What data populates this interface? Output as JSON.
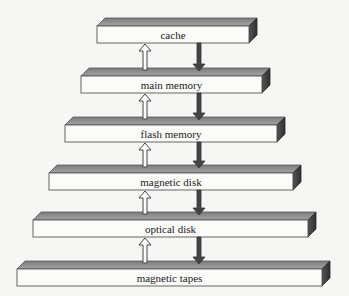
{
  "diagram": {
    "colors": {
      "background": "#f6f6f4",
      "front_face": "#fbfbfa",
      "top_face": "#8c8c8c",
      "side_face": "#3e3e3e",
      "outline": "#555555",
      "up_arrow_fill": "#ffffff",
      "down_arrow_fill": "#444444"
    },
    "levels": [
      {
        "label": "cache",
        "x": 97,
        "y": 26,
        "width": 152
      },
      {
        "label": "main memory",
        "x": 81,
        "y": 76,
        "width": 181
      },
      {
        "label": "flash memory",
        "x": 65,
        "y": 125,
        "width": 212
      },
      {
        "label": "magnetic disk",
        "x": 49,
        "y": 173,
        "width": 244
      },
      {
        "label": "optical disk",
        "x": 33,
        "y": 220,
        "width": 275
      },
      {
        "label": "magnetic tapes",
        "x": 17,
        "y": 269,
        "width": 305
      }
    ],
    "up_arrow_x": 145,
    "down_arrow_x": 199
  }
}
